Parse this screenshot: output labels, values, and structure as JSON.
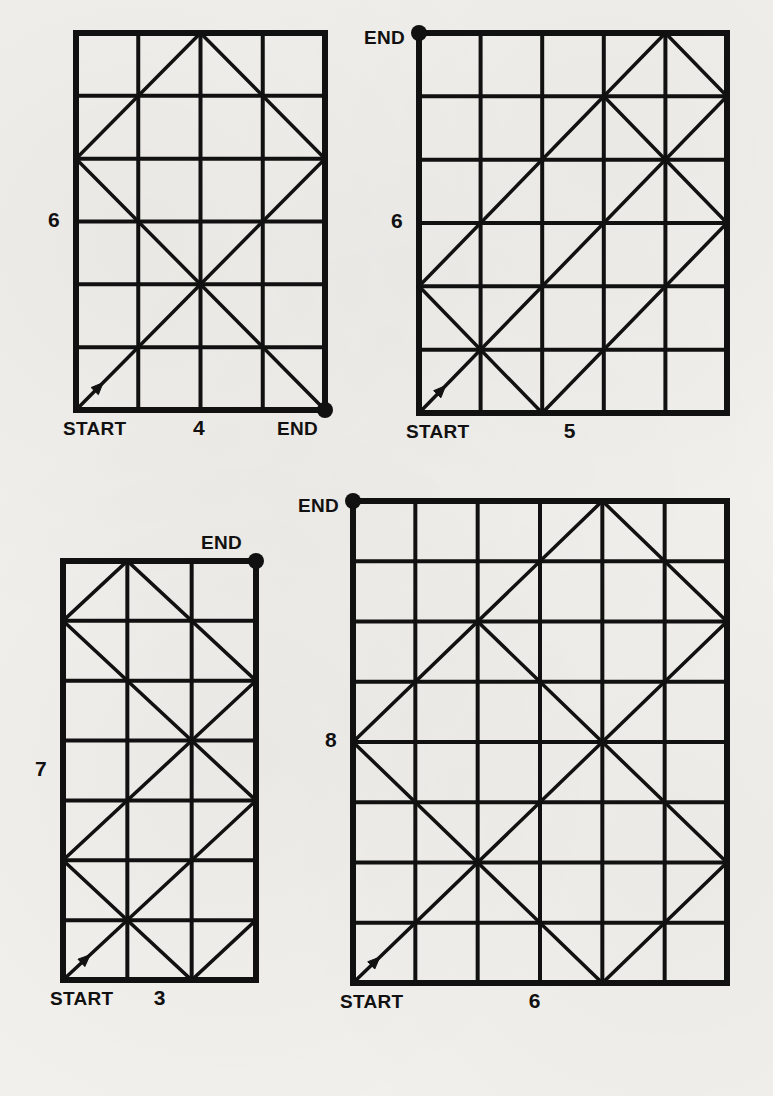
{
  "page": {
    "background_color": "#f2f0ec",
    "ink_color": "#111111",
    "width": 773,
    "height": 1096
  },
  "figures": [
    {
      "id": "figure-1",
      "cols": 4,
      "rows": 6,
      "width_label": "4",
      "height_label": "6",
      "start_label": "START",
      "end_label": "END",
      "start_corner": [
        0,
        0
      ],
      "end_corner": [
        4,
        0
      ],
      "end_label_position": "bottom-right",
      "height_label_position": "left",
      "path": [
        [
          0,
          0
        ],
        [
          4,
          4
        ],
        [
          2,
          6
        ],
        [
          0,
          4
        ],
        [
          4,
          0
        ]
      ],
      "geometry": {
        "x": 76,
        "y": 33,
        "w": 249,
        "h": 377
      }
    },
    {
      "id": "figure-2",
      "cols": 5,
      "rows": 6,
      "width_label": "5",
      "height_label": "6",
      "start_label": "START",
      "end_label": "END",
      "start_corner": [
        0,
        0
      ],
      "end_corner": [
        0,
        6
      ],
      "end_label_position": "top-left",
      "height_label_position": "left",
      "path": [
        [
          0,
          0
        ],
        [
          5,
          5
        ],
        [
          4,
          6
        ],
        [
          0,
          2
        ],
        [
          2,
          0
        ],
        [
          5,
          3
        ],
        [
          3,
          5
        ],
        [
          0,
          2
        ]
      ],
      "geometry": {
        "x": 419,
        "y": 33,
        "w": 308,
        "h": 380
      }
    },
    {
      "id": "figure-3",
      "cols": 3,
      "rows": 7,
      "width_label": "3",
      "height_label": "7",
      "start_label": "START",
      "end_label": "END",
      "start_corner": [
        0,
        0
      ],
      "end_corner": [
        3,
        7
      ],
      "end_label_position": "top-right",
      "height_label_position": "left",
      "path": [
        [
          0,
          0
        ],
        [
          3,
          3
        ],
        [
          0,
          6
        ],
        [
          1,
          7
        ],
        [
          3,
          5
        ],
        [
          0,
          2
        ],
        [
          2,
          0
        ],
        [
          3,
          1
        ]
      ],
      "geometry": {
        "x": 63,
        "y": 561,
        "w": 193,
        "h": 419
      }
    },
    {
      "id": "figure-4",
      "cols": 6,
      "rows": 8,
      "width_label": "6",
      "height_label": "8",
      "start_label": "START",
      "end_label": "END",
      "start_corner": [
        0,
        0
      ],
      "end_corner": [
        0,
        8
      ],
      "end_label_position": "top-left",
      "height_label_position": "left",
      "path": [
        [
          0,
          0
        ],
        [
          6,
          6
        ],
        [
          4,
          8
        ],
        [
          0,
          4
        ],
        [
          4,
          0
        ],
        [
          6,
          2
        ],
        [
          2,
          6
        ],
        [
          0,
          4
        ]
      ],
      "geometry": {
        "x": 353,
        "y": 501,
        "w": 374,
        "h": 482
      }
    }
  ]
}
